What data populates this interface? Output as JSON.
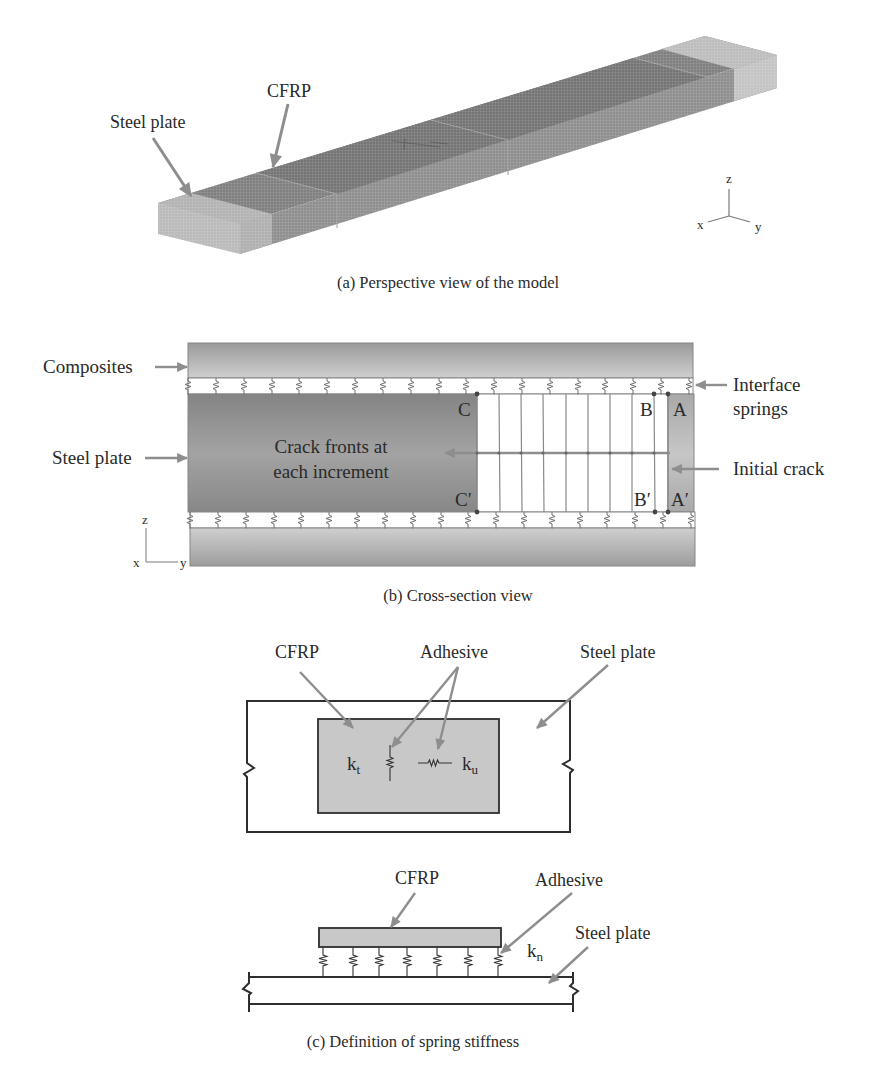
{
  "figure": {
    "panel_a": {
      "caption": "(a) Perspective view of the model",
      "label_steel_plate": "Steel plate",
      "label_cfrp": "CFRP",
      "axes": {
        "x": "x",
        "y": "y",
        "z": "z"
      }
    },
    "panel_b": {
      "caption": "(b) Cross-section view",
      "label_composites": "Composites",
      "label_steel_plate": "Steel plate",
      "label_interface_springs": [
        "Interface",
        "springs"
      ],
      "label_initial_crack": "Initial crack",
      "label_crack_fronts": [
        "Crack fronts at",
        "each increment"
      ],
      "points": {
        "C": "C",
        "B": "B",
        "A": "A",
        "C_prime": "C′",
        "B_prime": "B′",
        "A_prime": "A′"
      },
      "axes": {
        "x": "x",
        "y": "y",
        "z": "z"
      }
    },
    "panel_c": {
      "caption": "(c) Definition of spring stiffness",
      "plan_view": {
        "label_cfrp": "CFRP",
        "label_adhesive": "Adhesive",
        "label_steel_plate": "Steel plate",
        "k_t": {
          "symbol": "k",
          "subscript": "t"
        },
        "k_u": {
          "symbol": "k",
          "subscript": "u"
        }
      },
      "side_view": {
        "label_cfrp": "CFRP",
        "label_adhesive": "Adhesive",
        "label_steel_plate": "Steel plate",
        "k_n": {
          "symbol": "k",
          "subscript": "n"
        }
      }
    }
  },
  "colors": {
    "arrow": "#8e8e8e",
    "composite": "#b5b5b5",
    "steel": "#949494",
    "initial_crack": "#b8b8b8",
    "cfrp_fill": "#c8c8c8",
    "ink": "#2e2e2e"
  }
}
